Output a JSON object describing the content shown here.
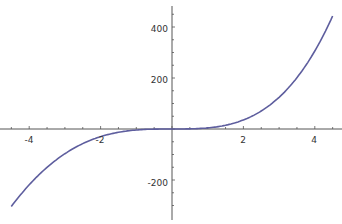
{
  "chart_data": {
    "type": "line",
    "title": "",
    "xlabel": "",
    "ylabel": "",
    "xlim": [
      -4.5,
      4.5
    ],
    "ylim": [
      -320,
      470
    ],
    "grid": false,
    "x_ticks": [
      "-4",
      "-2",
      "2",
      "4"
    ],
    "y_ticks": [
      "400",
      "200",
      "-200"
    ],
    "series": [
      {
        "name": "f(x)",
        "color": "#5e5e9e",
        "x": [
          -4.5,
          -4,
          -3,
          -2,
          -1,
          0,
          1,
          2,
          3,
          4,
          4.5
        ],
        "y": [
          -304,
          -219,
          -97,
          -30,
          -4,
          0,
          4,
          36,
          124,
          306,
          443
        ]
      }
    ]
  }
}
